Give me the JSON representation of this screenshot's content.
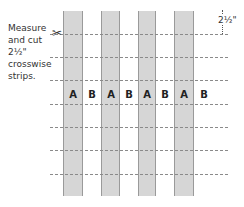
{
  "instruction": {
    "line1": "Measure",
    "line2": "and cut",
    "line3": "2½\"",
    "line4": "crosswise",
    "line5": "strips."
  },
  "dimension_label": "2½\"",
  "strips": [
    {
      "label": "A",
      "fill": "#d6d6d6"
    },
    {
      "label": "B",
      "fill": "#ffffff"
    },
    {
      "label": "A",
      "fill": "#d6d6d6"
    },
    {
      "label": "B",
      "fill": "#ffffff"
    },
    {
      "label": "A",
      "fill": "#d6d6d6"
    },
    {
      "label": "B",
      "fill": "#ffffff"
    },
    {
      "label": "A",
      "fill": "#d6d6d6"
    },
    {
      "label": "B",
      "fill": "#ffffff"
    }
  ],
  "icons": {
    "scissors": "✂"
  }
}
